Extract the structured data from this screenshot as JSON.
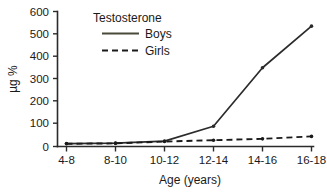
{
  "chart_data": {
    "type": "line",
    "title": "",
    "legend_title": "Testosterone",
    "legend_position": "top-center",
    "categories": [
      "4-8",
      "8-10",
      "10-12",
      "12-14",
      "14-16",
      "16-18"
    ],
    "series": [
      {
        "name": "Boys",
        "values": [
          13,
          15,
          24,
          90,
          350,
          535
        ],
        "style": "solid",
        "color": "#2b2b2b"
      },
      {
        "name": "Girls",
        "values": [
          12,
          14,
          22,
          28,
          34,
          45
        ],
        "style": "dashed",
        "color": "#1a1a1a"
      }
    ],
    "xlabel": "Age (years)",
    "ylabel": "µg %",
    "ylim": [
      0,
      600
    ],
    "yticks": [
      0,
      100,
      200,
      300,
      400,
      500,
      600
    ],
    "ytick_labels": [
      "0",
      "100",
      "200",
      "300",
      "400",
      "500",
      "600"
    ],
    "xtick_labels": [
      "4-8",
      "8-10",
      "10-12",
      "12-14",
      "14-16",
      "16-18"
    ],
    "grid": false
  },
  "legend": {
    "title": "Testosterone",
    "entries": [
      {
        "label": "Boys",
        "style": "solid"
      },
      {
        "label": "Girls",
        "style": "dashed"
      }
    ]
  },
  "axes": {
    "x_title": "Age (years)",
    "y_title": "µg %"
  },
  "colors": {
    "axis": "#2b2b2b",
    "boys_line": "#2b2b2b",
    "girls_line": "#1a1a1a",
    "background": "#ffffff",
    "text": "#1a1a1a"
  }
}
